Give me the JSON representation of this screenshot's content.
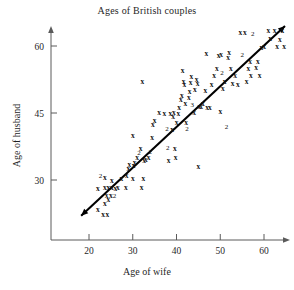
{
  "chart_data": {
    "type": "scatter",
    "title": "Ages of British couples",
    "xlabel": "Age of wife",
    "ylabel": "Age of husband",
    "xlim": [
      14,
      66
    ],
    "ylim": [
      18,
      66
    ],
    "xticks": [
      20,
      30,
      40,
      50,
      60
    ],
    "yticks": [
      30,
      45,
      60
    ],
    "xtick_labels": [
      "20",
      "30",
      "40",
      "50",
      "60"
    ],
    "ytick_labels": [
      "30",
      "45",
      "60"
    ],
    "grid": false,
    "legend": null,
    "marker": "x",
    "point_label_note": "numeric labels indicate count of coincident points",
    "trend_line": {
      "type": "linear-fit",
      "x_start": 18.2,
      "y_start": 22.0,
      "x_end": 64.8,
      "y_end": 64.5,
      "arrow_both_ends": true
    },
    "points": [
      {
        "x": 22.0,
        "y": 23.5,
        "n": 1
      },
      {
        "x": 23.2,
        "y": 22.2,
        "n": 1
      },
      {
        "x": 24.2,
        "y": 22.2,
        "n": 1
      },
      {
        "x": 23.6,
        "y": 24.8,
        "n": 1
      },
      {
        "x": 24.4,
        "y": 25.6,
        "n": 1
      },
      {
        "x": 24.0,
        "y": 26.6,
        "n": 1
      },
      {
        "x": 25.0,
        "y": 26.6,
        "n": 1
      },
      {
        "x": 22.0,
        "y": 28.2,
        "n": 1
      },
      {
        "x": 23.6,
        "y": 28.3,
        "n": 1
      },
      {
        "x": 24.4,
        "y": 28.3,
        "n": 1
      },
      {
        "x": 25.2,
        "y": 28.4,
        "n": 1
      },
      {
        "x": 26.0,
        "y": 28.2,
        "n": 1
      },
      {
        "x": 22.6,
        "y": 31.0,
        "n": 2
      },
      {
        "x": 23.6,
        "y": 30.6,
        "n": 1
      },
      {
        "x": 25.2,
        "y": 29.8,
        "n": 1
      },
      {
        "x": 25.8,
        "y": 26.5,
        "n": 2
      },
      {
        "x": 26.6,
        "y": 28.4,
        "n": 1
      },
      {
        "x": 27.4,
        "y": 30.3,
        "n": 1
      },
      {
        "x": 28.4,
        "y": 28.3,
        "n": 1
      },
      {
        "x": 28.6,
        "y": 31.0,
        "n": 1
      },
      {
        "x": 29.0,
        "y": 32.6,
        "n": 1
      },
      {
        "x": 29.2,
        "y": 33.4,
        "n": 1
      },
      {
        "x": 30.0,
        "y": 30.3,
        "n": 1
      },
      {
        "x": 30.2,
        "y": 33.2,
        "n": 1
      },
      {
        "x": 30.4,
        "y": 34.0,
        "n": 1
      },
      {
        "x": 31.0,
        "y": 35.0,
        "n": 1
      },
      {
        "x": 31.4,
        "y": 36.2,
        "n": 2
      },
      {
        "x": 31.8,
        "y": 37.0,
        "n": 1
      },
      {
        "x": 32.4,
        "y": 30.4,
        "n": 1
      },
      {
        "x": 32.0,
        "y": 28.3,
        "n": 1
      },
      {
        "x": 32.6,
        "y": 34.3,
        "n": 1
      },
      {
        "x": 33.0,
        "y": 34.6,
        "n": 1
      },
      {
        "x": 33.6,
        "y": 35.0,
        "n": 1
      },
      {
        "x": 34.0,
        "y": 36.3,
        "n": 2
      },
      {
        "x": 30.0,
        "y": 40.0,
        "n": 1
      },
      {
        "x": 32.2,
        "y": 52.0,
        "n": 1
      },
      {
        "x": 34.4,
        "y": 39.6,
        "n": 1
      },
      {
        "x": 34.6,
        "y": 42.4,
        "n": 1
      },
      {
        "x": 35.0,
        "y": 43.4,
        "n": 1
      },
      {
        "x": 36.0,
        "y": 45.1,
        "n": 1
      },
      {
        "x": 37.2,
        "y": 45.0,
        "n": 1
      },
      {
        "x": 37.8,
        "y": 41.6,
        "n": 2
      },
      {
        "x": 38.0,
        "y": 37.2,
        "n": 2
      },
      {
        "x": 38.2,
        "y": 34.4,
        "n": 1
      },
      {
        "x": 38.6,
        "y": 45.0,
        "n": 1
      },
      {
        "x": 39.2,
        "y": 44.2,
        "n": 1
      },
      {
        "x": 39.4,
        "y": 45.1,
        "n": 1
      },
      {
        "x": 39.0,
        "y": 41.4,
        "n": 1
      },
      {
        "x": 39.6,
        "y": 37.0,
        "n": 1
      },
      {
        "x": 39.8,
        "y": 35.0,
        "n": 1
      },
      {
        "x": 40.0,
        "y": 43.0,
        "n": 1
      },
      {
        "x": 40.4,
        "y": 44.8,
        "n": 1
      },
      {
        "x": 40.6,
        "y": 46.2,
        "n": 1
      },
      {
        "x": 41.0,
        "y": 48.0,
        "n": 1
      },
      {
        "x": 41.2,
        "y": 49.0,
        "n": 1
      },
      {
        "x": 41.4,
        "y": 54.6,
        "n": 1
      },
      {
        "x": 41.6,
        "y": 52.0,
        "n": 1
      },
      {
        "x": 41.8,
        "y": 51.4,
        "n": 1
      },
      {
        "x": 42.0,
        "y": 47.2,
        "n": 1
      },
      {
        "x": 42.2,
        "y": 43.0,
        "n": 1
      },
      {
        "x": 42.4,
        "y": 41.5,
        "n": 2
      },
      {
        "x": 42.8,
        "y": 48.6,
        "n": 1
      },
      {
        "x": 43.0,
        "y": 49.8,
        "n": 1
      },
      {
        "x": 43.2,
        "y": 51.8,
        "n": 1
      },
      {
        "x": 43.4,
        "y": 53.2,
        "n": 1
      },
      {
        "x": 43.6,
        "y": 47.0,
        "n": 3
      },
      {
        "x": 44.0,
        "y": 45.2,
        "n": 1
      },
      {
        "x": 44.2,
        "y": 50.2,
        "n": 1
      },
      {
        "x": 44.6,
        "y": 52.6,
        "n": 1
      },
      {
        "x": 44.8,
        "y": 51.6,
        "n": 1
      },
      {
        "x": 45.0,
        "y": 33.0,
        "n": 1
      },
      {
        "x": 45.2,
        "y": 46.5,
        "n": 1
      },
      {
        "x": 45.6,
        "y": 46.4,
        "n": 1
      },
      {
        "x": 46.0,
        "y": 47.2,
        "n": 1
      },
      {
        "x": 46.6,
        "y": 50.0,
        "n": 1
      },
      {
        "x": 46.8,
        "y": 58.4,
        "n": 1
      },
      {
        "x": 47.0,
        "y": 46.3,
        "n": 1
      },
      {
        "x": 47.6,
        "y": 46.3,
        "n": 1
      },
      {
        "x": 48.0,
        "y": 51.4,
        "n": 1
      },
      {
        "x": 48.6,
        "y": 53.4,
        "n": 1
      },
      {
        "x": 49.2,
        "y": 55.0,
        "n": 1
      },
      {
        "x": 49.6,
        "y": 57.8,
        "n": 1
      },
      {
        "x": 50.0,
        "y": 45.4,
        "n": 1
      },
      {
        "x": 50.2,
        "y": 58.2,
        "n": 1
      },
      {
        "x": 50.4,
        "y": 54.0,
        "n": 2
      },
      {
        "x": 50.6,
        "y": 50.4,
        "n": 1
      },
      {
        "x": 51.0,
        "y": 52.0,
        "n": 1
      },
      {
        "x": 51.4,
        "y": 42.0,
        "n": 2
      },
      {
        "x": 51.8,
        "y": 57.4,
        "n": 1
      },
      {
        "x": 52.0,
        "y": 58.6,
        "n": 1
      },
      {
        "x": 52.4,
        "y": 55.0,
        "n": 1
      },
      {
        "x": 52.8,
        "y": 51.6,
        "n": 1
      },
      {
        "x": 53.4,
        "y": 53.4,
        "n": 1
      },
      {
        "x": 54.0,
        "y": 51.4,
        "n": 1
      },
      {
        "x": 54.6,
        "y": 63.0,
        "n": 1
      },
      {
        "x": 55.0,
        "y": 58.0,
        "n": 2
      },
      {
        "x": 55.6,
        "y": 63.0,
        "n": 1
      },
      {
        "x": 56.0,
        "y": 52.0,
        "n": 1
      },
      {
        "x": 56.4,
        "y": 55.0,
        "n": 1
      },
      {
        "x": 56.8,
        "y": 56.6,
        "n": 1
      },
      {
        "x": 57.0,
        "y": 53.4,
        "n": 1
      },
      {
        "x": 57.4,
        "y": 62.8,
        "n": 2
      },
      {
        "x": 58.2,
        "y": 55.2,
        "n": 1
      },
      {
        "x": 58.6,
        "y": 56.6,
        "n": 1
      },
      {
        "x": 59.0,
        "y": 53.4,
        "n": 1
      },
      {
        "x": 59.4,
        "y": 59.6,
        "n": 1
      },
      {
        "x": 60.0,
        "y": 60.0,
        "n": 1
      },
      {
        "x": 61.0,
        "y": 63.4,
        "n": 1
      },
      {
        "x": 61.4,
        "y": 61.6,
        "n": 1
      },
      {
        "x": 62.4,
        "y": 63.4,
        "n": 1
      },
      {
        "x": 63.0,
        "y": 60.0,
        "n": 1
      },
      {
        "x": 63.6,
        "y": 61.4,
        "n": 1
      },
      {
        "x": 64.2,
        "y": 63.6,
        "n": 1
      },
      {
        "x": 64.6,
        "y": 60.0,
        "n": 1
      }
    ]
  }
}
